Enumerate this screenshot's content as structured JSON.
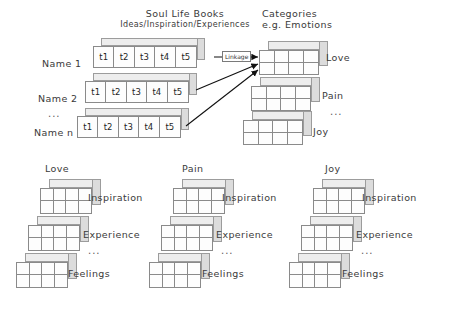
{
  "figure": {
    "background": "#ffffff",
    "line_color": "#8a8a8a"
  },
  "top_section": {
    "left_header": {
      "line1": "Soul Life Books",
      "line2": "Ideas/Inspiration/Experiences"
    },
    "right_header": {
      "line1": "Categories",
      "line2": "e.g. Emotions"
    },
    "row_labels": [
      "Name 1",
      "Name 2",
      "...",
      "Name n"
    ],
    "cell_labels": [
      "t1",
      "t2",
      "t3",
      "t4",
      "t5"
    ],
    "rows": [
      {
        "name": "Name 1",
        "cells": [
          "t1",
          "t2",
          "t3",
          "t4",
          "t5"
        ]
      },
      {
        "name": "Name 2",
        "cells": [
          "t1",
          "t2",
          "t3",
          "t4",
          "t5"
        ]
      },
      {
        "name": "Name n",
        "cells": [
          "t1",
          "t2",
          "t3",
          "t4",
          "t5"
        ]
      }
    ],
    "ellipsis": "...",
    "linkage_label": "Linkage",
    "category_labels": [
      "Love",
      "Pain",
      "...",
      "Joy"
    ],
    "categories": [
      {
        "label": "Love",
        "grid_cols": 4,
        "grid_rows": 2
      },
      {
        "label": "Pain",
        "grid_cols": 4,
        "grid_rows": 2
      },
      {
        "label": "Joy",
        "grid_cols": 4,
        "grid_rows": 2
      }
    ]
  },
  "bottom_section": {
    "tier_labels": [
      "Inspiration",
      "Experience",
      "...",
      "Feelings"
    ],
    "groups": [
      {
        "title": "Love",
        "tiers": [
          {
            "label": "Inspiration",
            "grid_cols": 4,
            "grid_rows": 2
          },
          {
            "label": "Experience",
            "grid_cols": 4,
            "grid_rows": 2
          },
          {
            "label": "Feelings",
            "grid_cols": 4,
            "grid_rows": 2
          }
        ],
        "ellipsis": "..."
      },
      {
        "title": "Pain",
        "tiers": [
          {
            "label": "Inspiration",
            "grid_cols": 4,
            "grid_rows": 2
          },
          {
            "label": "Experience",
            "grid_cols": 4,
            "grid_rows": 2
          },
          {
            "label": "Feelings",
            "grid_cols": 4,
            "grid_rows": 2
          }
        ],
        "ellipsis": "..."
      },
      {
        "title": "Joy",
        "tiers": [
          {
            "label": "Inspiration",
            "grid_cols": 4,
            "grid_rows": 2
          },
          {
            "label": "Experience",
            "grid_cols": 4,
            "grid_rows": 2
          },
          {
            "label": "Feelings",
            "grid_cols": 4,
            "grid_rows": 2
          }
        ],
        "ellipsis": "..."
      }
    ]
  }
}
